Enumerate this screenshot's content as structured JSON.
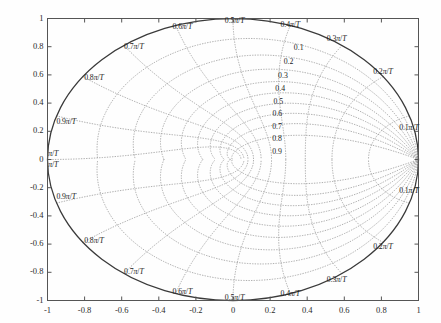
{
  "figure": {
    "title": "",
    "background_color": "#ffffff",
    "axis_box_color": "#555555",
    "unit_circle_color": "#3a3a3a",
    "grid_color": "#9a9a9a",
    "grid_style": "dotted",
    "text_color": "#1a1a1a"
  },
  "axes": {
    "xlabel": "",
    "ylabel": "",
    "xlim": [
      -1,
      1
    ],
    "ylim": [
      -1,
      1
    ],
    "xticks": [
      "-1",
      "-0.8",
      "-0.6",
      "-0.4",
      "-0.2",
      "0",
      "0.2",
      "0.4",
      "0.6",
      "0.8",
      "1"
    ],
    "xtick_values": [
      -1,
      -0.8,
      -0.6,
      -0.4,
      -0.2,
      0,
      0.2,
      0.4,
      0.6,
      0.8,
      1
    ],
    "yticks": [
      "1",
      "0.8",
      "0.6",
      "0.4",
      "0.2",
      "0",
      "-0.2",
      "-0.4",
      "-0.6",
      "-0.8",
      "-1"
    ],
    "ytick_values": [
      1,
      0.8,
      0.6,
      0.4,
      0.2,
      0,
      -0.2,
      -0.4,
      -0.6,
      -0.8,
      -1
    ],
    "grid": true,
    "box": true
  },
  "chart_data": {
    "type": "line",
    "title": "",
    "xlabel": "",
    "ylabel": "",
    "xlim": [
      -1,
      1
    ],
    "ylim": [
      -1,
      1
    ],
    "grid": true,
    "legend": "none",
    "unit_circle": {
      "center": [
        0,
        0
      ],
      "radius": 1
    },
    "damping_ratios": [
      0.1,
      0.2,
      0.3,
      0.4,
      0.5,
      0.6,
      0.7,
      0.8,
      0.9
    ],
    "damping_labels": [
      "0.1",
      "0.2",
      "0.3",
      "0.4",
      "0.5",
      "0.6",
      "0.7",
      "0.8",
      "0.9"
    ],
    "natural_frequencies_pi_over_T": [
      0.1,
      0.2,
      0.3,
      0.4,
      0.5,
      0.6,
      0.7,
      0.8,
      0.9,
      1.0
    ],
    "frequency_labels": [
      "0.1π/T",
      "0.2π/T",
      "0.3π/T",
      "0.4π/T",
      "0.5π/T",
      "0.6π/T",
      "0.7π/T",
      "0.8π/T",
      "0.9π/T",
      "π/T"
    ],
    "convergence_point": [
      1,
      0
    ]
  },
  "annotations": {
    "frequency_upper": [
      {
        "text": "0.1π/T",
        "x": 0.955,
        "y": 0.225
      },
      {
        "text": "0.2π/T",
        "x": 0.815,
        "y": 0.618
      },
      {
        "text": "0.3π/T",
        "x": 0.565,
        "y": 0.855
      },
      {
        "text": "0.4π/T",
        "x": 0.31,
        "y": 0.955
      },
      {
        "text": "0.5π/T",
        "x": 0.01,
        "y": 0.985
      },
      {
        "text": "0.6π/T",
        "x": -0.272,
        "y": 0.94
      },
      {
        "text": "0.7π/T",
        "x": -0.585,
        "y": 0.8
      },
      {
        "text": "0.8π/T",
        "x": -0.8,
        "y": 0.58
      },
      {
        "text": "0.9π/T",
        "x": -0.95,
        "y": 0.265
      },
      {
        "text": "π/T",
        "x": -0.995,
        "y": 0.04
      }
    ],
    "frequency_lower": [
      {
        "text": "π/T",
        "x": -0.995,
        "y": -0.04
      },
      {
        "text": "0.9π/T",
        "x": -0.95,
        "y": -0.265
      },
      {
        "text": "0.8π/T",
        "x": -0.8,
        "y": -0.58
      },
      {
        "text": "0.7π/T",
        "x": -0.585,
        "y": -0.8
      },
      {
        "text": "0.6π/T",
        "x": -0.272,
        "y": -0.94
      },
      {
        "text": "0.5π/T",
        "x": 0.01,
        "y": -0.985
      },
      {
        "text": "0.4π/T",
        "x": 0.31,
        "y": -0.955
      },
      {
        "text": "0.3π/T",
        "x": 0.565,
        "y": -0.855
      },
      {
        "text": "0.2π/T",
        "x": 0.815,
        "y": -0.618
      },
      {
        "text": "0.1π/T",
        "x": 0.955,
        "y": -0.225
      }
    ],
    "damping": [
      {
        "text": "0.1",
        "x": 0.355,
        "y": 0.79
      },
      {
        "text": "0.2",
        "x": 0.3,
        "y": 0.69
      },
      {
        "text": "0.3",
        "x": 0.27,
        "y": 0.592
      },
      {
        "text": "0.4",
        "x": 0.255,
        "y": 0.5
      },
      {
        "text": "0.5",
        "x": 0.245,
        "y": 0.408
      },
      {
        "text": "0.6",
        "x": 0.24,
        "y": 0.32
      },
      {
        "text": "0.7",
        "x": 0.238,
        "y": 0.232
      },
      {
        "text": "0.8",
        "x": 0.238,
        "y": 0.145
      },
      {
        "text": "0.9",
        "x": 0.238,
        "y": 0.055
      }
    ]
  }
}
